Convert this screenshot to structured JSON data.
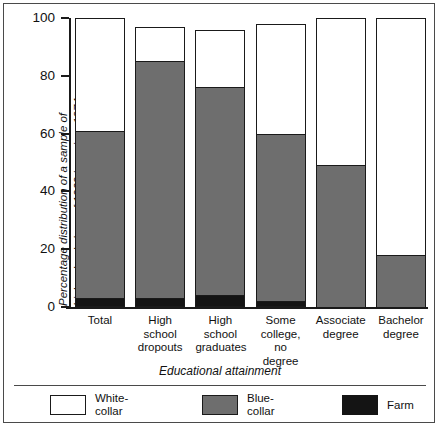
{
  "chart_data": {
    "type": "bar",
    "subtype": "stacked-bar-100-percent",
    "title": "",
    "xlabel": "Educational attainment",
    "ylabel": "Percentage distribution of a sample of high school class of 1969 in spring, 1974",
    "ylim": [
      0,
      100
    ],
    "yticks": [
      0,
      20,
      40,
      60,
      80,
      100
    ],
    "ytick_labels": [
      "0",
      "20",
      "40",
      "60",
      "80",
      "100"
    ],
    "grid": false,
    "legend_position": "bottom",
    "categories": [
      "Total",
      "High school dropouts",
      "High school graduates",
      "Some college, no degree",
      "Associate degree",
      "Bachelor degree"
    ],
    "series": [
      {
        "name": "White-collar",
        "color": "#ffffff",
        "values": [
          39,
          12,
          20,
          38,
          51,
          82
        ]
      },
      {
        "name": "Blue-collar",
        "color": "#6e6e6e",
        "values": [
          58,
          82,
          72,
          58,
          49,
          18
        ]
      },
      {
        "name": "Farm",
        "color": "#141414",
        "values": [
          3,
          3,
          4,
          2,
          0,
          0
        ]
      }
    ],
    "segment_boundaries_percent": {
      "note": "cumulative top edge of each stacked segment, bottom to top",
      "Total": {
        "farm_top": 3,
        "blue_top": 61,
        "white_top": 100
      },
      "High school dropouts": {
        "farm_top": 3,
        "blue_top": 85,
        "white_top": 100
      },
      "High school graduates": {
        "farm_top": 4,
        "blue_top": 76,
        "white_top": 100
      },
      "Some college, no degree": {
        "farm_top": 2,
        "blue_top": 60,
        "white_top": 100
      },
      "Associate degree": {
        "farm_top": 0,
        "blue_top": 49,
        "white_top": 100
      },
      "Bachelor degree": {
        "farm_top": 0,
        "blue_top": 18,
        "white_top": 100
      }
    }
  },
  "axis": {
    "y_title": "Percentage distribution of a sample of\nhigh school class of 1969 in spring, 1974",
    "y_title_line1": "Percentage distribution of a sample of",
    "y_title_line2": "high school class of 1969 in spring, 1974",
    "x_title": "Educational attainment",
    "y_ticks": [
      "100",
      "80",
      "60",
      "40",
      "20",
      "0"
    ]
  },
  "x_labels": [
    {
      "line1": "Total",
      "line2": "",
      "line3": ""
    },
    {
      "line1": "High",
      "line2": "school",
      "line3": "dropouts"
    },
    {
      "line1": "High",
      "line2": "school",
      "line3": "graduates"
    },
    {
      "line1": "Some",
      "line2": "college,",
      "line3": "no degree"
    },
    {
      "line1": "Associate",
      "line2": "degree",
      "line3": ""
    },
    {
      "line1": "Bachelor",
      "line2": "degree",
      "line3": ""
    }
  ],
  "legend": [
    {
      "label_line1": "White-",
      "label_line2": "collar",
      "color": "#ffffff",
      "swatch": "white-collar-swatch"
    },
    {
      "label_line1": "Blue-",
      "label_line2": "collar",
      "color": "#6e6e6e",
      "swatch": "blue-collar-swatch"
    },
    {
      "label_line1": "Farm",
      "label_line2": "",
      "color": "#141414",
      "swatch": "farm-swatch"
    }
  ],
  "colors": {
    "white_collar": "#ffffff",
    "blue_collar": "#6e6e6e",
    "farm": "#141414",
    "outline": "#1a1a1a",
    "frame": "#4a4a4a",
    "background": "#ffffff"
  }
}
